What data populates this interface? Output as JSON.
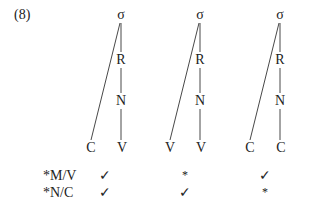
{
  "example": {
    "number": "(8)"
  },
  "trees": [
    {
      "id": "tree-1",
      "root": "σ",
      "rime": "R",
      "nucleus": "N",
      "left_leaf": "C",
      "right_leaf": "V"
    },
    {
      "id": "tree-2",
      "root": "σ",
      "rime": "R",
      "nucleus": "N",
      "left_leaf": "V",
      "right_leaf": "V"
    },
    {
      "id": "tree-3",
      "root": "σ",
      "rime": "R",
      "nucleus": "N",
      "left_leaf": "C",
      "right_leaf": "C"
    }
  ],
  "constraints": [
    {
      "label": "*M/V",
      "marks": [
        "✓",
        "*",
        "✓"
      ]
    },
    {
      "label": "*N/C",
      "marks": [
        "✓",
        "✓",
        "*"
      ]
    }
  ]
}
